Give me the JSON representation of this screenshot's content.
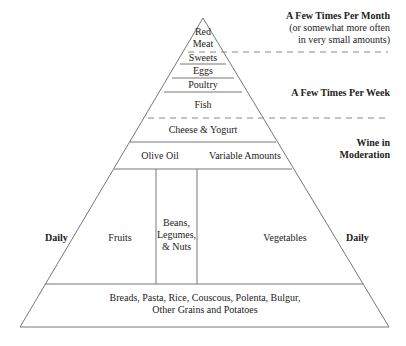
{
  "pyramid": {
    "tiers": {
      "red_meat_1": "Red",
      "red_meat_2": "Meat",
      "sweets": "Sweets",
      "eggs": "Eggs",
      "poultry": "Poultry",
      "fish": "Fish",
      "cheese_yogurt": "Cheese & Yogurt",
      "olive_oil": "Olive Oil",
      "variable_amounts": "Variable Amounts",
      "fruits": "Fruits",
      "beans_1": "Beans,",
      "beans_2": "Legumes,",
      "beans_3": "& Nuts",
      "vegetables": "Vegetables",
      "grains_1": "Breads, Pasta, Rice, Couscous, Polenta, Bulgur,",
      "grains_2": "Other Grains and Potatoes"
    },
    "frequency_labels": {
      "monthly_title": "A Few Times Per Month",
      "monthly_note_1": "(or somewhat more often",
      "monthly_note_2": "in very small amounts)",
      "weekly": "A Few Times Per Week",
      "wine_1": "Wine in",
      "wine_2": "Moderation",
      "daily_left": "Daily",
      "daily_right": "Daily"
    },
    "colors": {
      "line": "#777777",
      "dash": "#888888",
      "text": "#222222"
    }
  }
}
